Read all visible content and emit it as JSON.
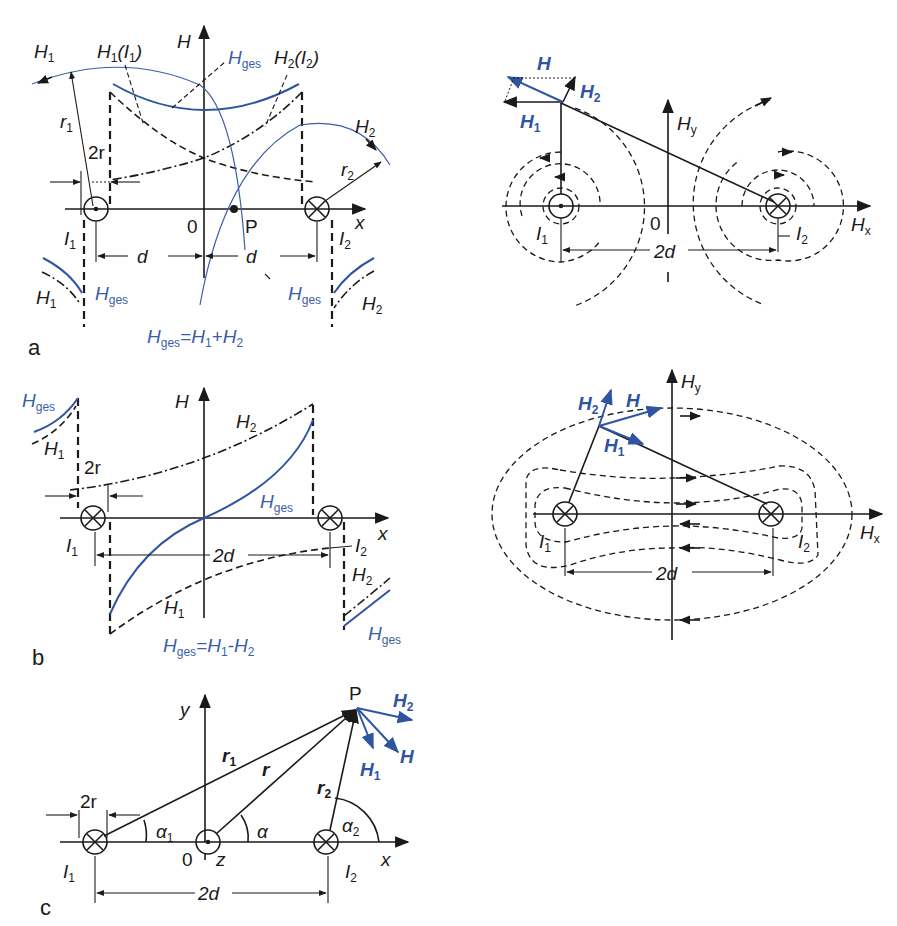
{
  "colors": {
    "ink": "#1a1a1a",
    "accent_blue": "#2f55a0"
  },
  "panel_labels": {
    "a": "a",
    "b": "b",
    "c": "c"
  },
  "symbols": {
    "H": "H",
    "H1": "H",
    "H2": "H",
    "Hges": "H",
    "sub_1": "1",
    "sub_2": "2",
    "sub_ges": "ges",
    "sub_x": "x",
    "sub_y": "y",
    "I": "I",
    "r": "r",
    "d": "d",
    "two_r": "2r",
    "two_d": "2d",
    "x": "x",
    "y": "y",
    "z": "z",
    "zero": "0",
    "P": "P",
    "alpha": "α",
    "paren_open": "(",
    "paren_close": ")"
  },
  "panel_a": {
    "formula": {
      "lhs": "H",
      "lhs_sub": "ges",
      "rhs": "=H",
      "rhs_sub1": "1",
      "plus": "+H",
      "rhs_sub2": "2"
    },
    "current_I1": "dot (out of page)",
    "current_I2": "cross (into page)"
  },
  "panel_b": {
    "formula": {
      "lhs": "H",
      "lhs_sub": "ges",
      "rhs": "=H",
      "rhs_sub1": "1",
      "minus": "-H",
      "rhs_sub2": "2"
    },
    "current_I1": "cross (into page)",
    "current_I2": "cross (into page)"
  },
  "panel_c": {
    "center_current": "dot (z-axis)",
    "current_I1": "cross (into page)",
    "current_I2": "cross (into page)"
  }
}
